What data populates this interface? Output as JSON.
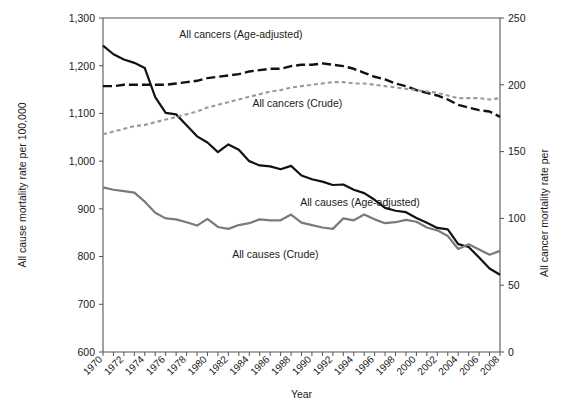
{
  "chart_data": {
    "type": "line",
    "title": "",
    "xlabel": "Year",
    "ylabel": "All cause mortality rate per 100,000",
    "y2label": "All cancer mortality rate per",
    "xlim": [
      1970,
      2008
    ],
    "ylim": [
      600,
      1300
    ],
    "y2lim": [
      0,
      250
    ],
    "grid": false,
    "legend_position": "inline-annotations",
    "x": [
      1970,
      1971,
      1972,
      1973,
      1974,
      1975,
      1976,
      1977,
      1978,
      1979,
      1980,
      1981,
      1982,
      1983,
      1984,
      1985,
      1986,
      1987,
      1988,
      1989,
      1990,
      1991,
      1992,
      1993,
      1994,
      1995,
      1996,
      1997,
      1998,
      1999,
      2000,
      2001,
      2002,
      2003,
      2004,
      2005,
      2006,
      2007,
      2008
    ],
    "xticks": [
      1970,
      1971,
      1972,
      1973,
      1974,
      1975,
      1976,
      1977,
      1978,
      1979,
      1980,
      1981,
      1982,
      1983,
      1984,
      1985,
      1986,
      1987,
      1988,
      1989,
      1990,
      1991,
      1992,
      1993,
      1994,
      1995,
      1996,
      1997,
      1998,
      1999,
      2000,
      2001,
      2002,
      2003,
      2004,
      2005,
      2006,
      2007,
      2008
    ],
    "xticklabels": [
      "1970",
      "1972",
      "1974",
      "1976",
      "1978",
      "1980",
      "1982",
      "1984",
      "1986",
      "1988",
      "1990",
      "1992",
      "1994",
      "1996",
      "1998",
      "2000",
      "2002",
      "2004",
      "2006",
      "2008"
    ],
    "xticklabel_years": [
      1970,
      1972,
      1974,
      1976,
      1978,
      1980,
      1982,
      1984,
      1986,
      1988,
      1990,
      1992,
      1994,
      1996,
      1998,
      2000,
      2002,
      2004,
      2006,
      2008
    ],
    "yticks": [
      600,
      700,
      800,
      900,
      1000,
      1100,
      1200,
      1300
    ],
    "yticklabels": [
      "600",
      "700",
      "800",
      "900",
      "1,000",
      "1,100",
      "1,200",
      "1,300"
    ],
    "y2ticks": [
      0,
      50,
      100,
      150,
      200,
      250
    ],
    "y2ticklabels": [
      "0",
      "50",
      "100",
      "150",
      "200",
      "250"
    ],
    "series": [
      {
        "name": "All causes (Age-adjusted)",
        "axis": "left",
        "style": "solid",
        "color": "#111111",
        "width": 2.2,
        "label_x": 1994.6,
        "label_y": 905,
        "values": [
          1242,
          1224,
          1213,
          1206,
          1195,
          1134,
          1101,
          1098,
          1075,
          1052,
          1039,
          1019,
          1035,
          1024,
          1000,
          991,
          989,
          983,
          990,
          970,
          962,
          957,
          950,
          951,
          940,
          933,
          919,
          902,
          896,
          893,
          881,
          871,
          860,
          857,
          826,
          820,
          798,
          775,
          762
        ]
      },
      {
        "name": "All causes (Crude)",
        "axis": "left",
        "style": "solid",
        "color": "#7a7a7a",
        "width": 2.2,
        "label_x": 1986.5,
        "label_y": 798,
        "values": [
          945,
          940,
          937,
          934,
          915,
          892,
          880,
          878,
          872,
          865,
          879,
          862,
          858,
          866,
          870,
          878,
          876,
          876,
          888,
          871,
          866,
          861,
          858,
          880,
          876,
          888,
          878,
          870,
          872,
          877,
          873,
          861,
          855,
          843,
          816,
          826,
          815,
          804,
          812
        ]
      },
      {
        "name": "All cancers (Age-adjusted)",
        "axis": "right",
        "style": "dashed-long",
        "color": "#111111",
        "width": 2.4,
        "label_x": 1983.2,
        "label_y": 1258,
        "values": [
          199,
          199,
          200,
          200,
          200,
          200,
          200,
          201,
          202,
          203,
          205,
          206,
          207,
          208,
          210,
          211,
          212,
          212,
          214,
          215,
          215,
          216,
          215,
          214,
          212,
          209,
          206,
          204,
          201,
          199,
          196,
          194,
          192,
          189,
          185,
          183,
          181,
          180,
          176
        ]
      },
      {
        "name": "All cancers (Crude)",
        "axis": "right",
        "style": "dashed-short",
        "color": "#9a9a9a",
        "width": 2.1,
        "label_x": 1988.6,
        "label_y": 1113,
        "values": [
          163,
          165,
          167,
          169,
          170,
          172,
          174,
          176,
          178,
          180,
          183,
          185,
          187,
          189,
          191,
          193,
          195,
          196,
          198,
          199,
          200,
          201,
          202,
          202,
          201,
          201,
          200,
          199,
          198,
          197,
          196,
          195,
          194,
          192,
          190,
          190,
          190,
          189,
          190
        ]
      }
    ]
  },
  "annotations": {
    "all_cancers_age_adjusted": "All cancers (Age-adjusted)",
    "all_cancers_crude": "All cancers (Crude)",
    "all_causes_age_adjusted": "All causes (Age-adjusted)",
    "all_causes_crude": "All causes (Crude)"
  },
  "axes": {
    "x_title": "Year",
    "y_left_title": "All cause mortality rate per 100,000",
    "y_right_title": "All cancer mortality rate per"
  },
  "colors": {
    "axis": "#555555",
    "black_series": "#111111",
    "gray_series": "#7a7a7a",
    "light_gray_series": "#9a9a9a",
    "background": "#ffffff"
  }
}
